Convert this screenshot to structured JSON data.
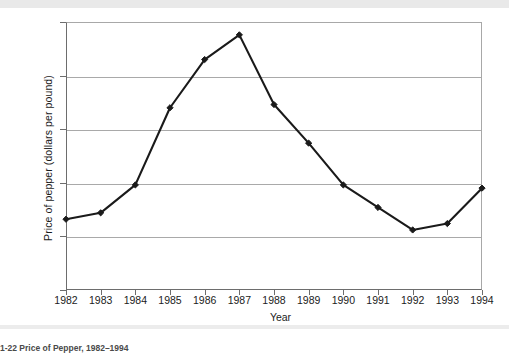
{
  "figure": {
    "caption_fragment": "1-22   Price of Pepper, 1982–1994"
  },
  "chart_data": {
    "type": "line",
    "title": "",
    "subtitle": "",
    "xlabel": "Year",
    "ylabel": "Price of pepper (dollars per pound)",
    "categories": [
      "1982",
      "1983",
      "1984",
      "1985",
      "1986",
      "1987",
      "1988",
      "1989",
      "1990",
      "1991",
      "1992",
      "1993",
      "1994"
    ],
    "x": [
      1982,
      1983,
      1984,
      1985,
      1986,
      1987,
      1988,
      1989,
      1990,
      1991,
      1992,
      1993,
      1994
    ],
    "values": [
      0.66,
      0.72,
      0.98,
      1.7,
      2.15,
      2.38,
      1.73,
      1.37,
      0.98,
      0.77,
      0.56,
      0.62,
      0.95
    ],
    "series": [
      {
        "name": "Price of pepper",
        "values": [
          0.66,
          0.72,
          0.98,
          1.7,
          2.15,
          2.38,
          1.73,
          1.37,
          0.98,
          0.77,
          0.56,
          0.62,
          0.95
        ]
      }
    ],
    "ylim": [
      0,
      2.5
    ],
    "xlim": [
      1982,
      1994
    ],
    "yticks": [
      0,
      0.5,
      1.0,
      1.5,
      2.0,
      2.5
    ],
    "ytick_labels": [
      "0",
      "0.50",
      "1.00",
      "1.50",
      "2.00",
      "2.50"
    ],
    "xtick_labels": [
      "1982",
      "1983",
      "1984",
      "1985",
      "1986",
      "1987",
      "1988",
      "1989",
      "1990",
      "1991",
      "1992",
      "1993",
      "1994"
    ],
    "grid": "horizontal",
    "legend": "none",
    "marker": "diamond",
    "line_color": "#1a1a1a",
    "marker_color": "#1a1a1a",
    "grid_color": "#a9a9a9",
    "axis_color": "#6d6d6d",
    "background_color": "#ffffff"
  }
}
